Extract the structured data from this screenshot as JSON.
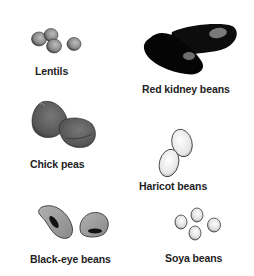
{
  "items": [
    {
      "id": "lentils",
      "label": "Lentils",
      "icon": "lentils-icon"
    },
    {
      "id": "red-kidney-beans",
      "label": "Red kidney beans",
      "icon": "red-kidney-beans-icon"
    },
    {
      "id": "chick-peas",
      "label": "Chick peas",
      "icon": "chick-peas-icon"
    },
    {
      "id": "haricot-beans",
      "label": "Haricot beans",
      "icon": "haricot-beans-icon"
    },
    {
      "id": "black-eye-beans",
      "label": "Black-eye beans",
      "icon": "black-eye-beans-icon"
    },
    {
      "id": "soya-beans",
      "label": "Soya beans",
      "icon": "soya-beans-icon"
    }
  ],
  "colors": {
    "background": "#ffffff",
    "text": "#1e1e1e",
    "kidney": "#0a0a0a",
    "chickpea": "#5a5a5a",
    "lentil": "#8a8a8a",
    "blackeye": "#9a9a9a",
    "haricot": "#ececec"
  }
}
